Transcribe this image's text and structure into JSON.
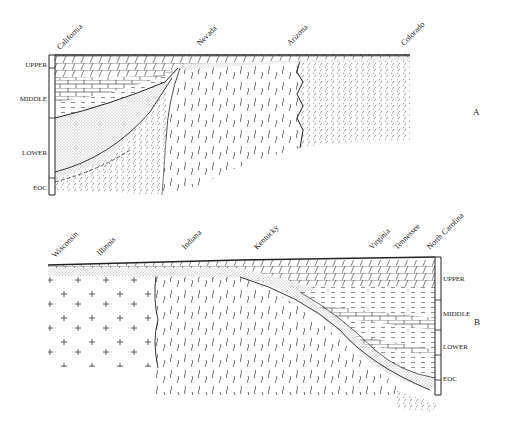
{
  "figure": {
    "type": "geologic cross-section",
    "panels": [
      {
        "id": "A",
        "label": "A",
        "states": [
          "California",
          "Nevada",
          "Arizona",
          "Colorado"
        ],
        "column_labels": [
          "UPPER",
          "MIDDLE",
          "LOWER",
          "EOC"
        ]
      },
      {
        "id": "B",
        "label": "B",
        "states": [
          "Wisconsin",
          "Illinois",
          "Indiana",
          "Kentucky",
          "Virginia",
          "Tennessee",
          "North Carolina"
        ],
        "column_labels": [
          "UPPER",
          "MIDDLE",
          "LOWER",
          "EOC"
        ]
      }
    ],
    "colors": {
      "ink": "#222222",
      "background": "#ffffff"
    }
  }
}
